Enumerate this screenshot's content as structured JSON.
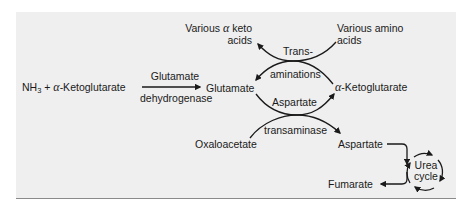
{
  "diagram": {
    "title": "",
    "nodes": {
      "various_keto_acids": {
        "line1_prefix": "Various ",
        "greek": "α",
        "line1_suffix": " keto",
        "line2": "acids"
      },
      "various_amino_acids": {
        "line1": "Various amino",
        "line2": "acids"
      },
      "nh3": {
        "base": "NH",
        "sub": "3",
        "plus": " + ",
        "greek": "α",
        "rest": "-Ketoglutarate"
      },
      "glutamate": "Glutamate",
      "alpha_ketoglutarate": {
        "greek": "α",
        "rest": "-Ketoglutarate"
      },
      "oxaloacetate": "Oxaloacetate",
      "aspartate": "Aspartate",
      "fumarate": "Fumarate",
      "urea_cycle": {
        "line1": "Urea",
        "line2": "cycle"
      }
    },
    "enzymes": {
      "glutamate_dehydrogenase": {
        "top": "Glutamate",
        "bottom": "dehydrogenase"
      },
      "transaminations": {
        "top": "Trans-",
        "bottom": "aminations"
      },
      "aspartate_transaminase": {
        "top": "Aspartate",
        "bottom": "transaminase"
      }
    },
    "edges": [
      {
        "from": "NH3 + α-Ketoglutarate",
        "to": "Glutamate",
        "label": "Glutamate dehydrogenase"
      },
      {
        "from": "Various amino acids",
        "to": "Glutamate",
        "label": "Transaminations"
      },
      {
        "from": "α-Ketoglutarate",
        "to": "Various α keto acids",
        "label": "Transaminations"
      },
      {
        "from": "Glutamate",
        "to": "α-Ketoglutarate",
        "label": "Aspartate transaminase"
      },
      {
        "from": "Oxaloacetate",
        "to": "Aspartate",
        "label": "Aspartate transaminase"
      },
      {
        "from": "Aspartate",
        "to": "Urea cycle"
      },
      {
        "from": "Urea cycle",
        "to": "Fumarate"
      }
    ],
    "colors": {
      "panel_bg": "#efefef",
      "ink": "#1a1a1a",
      "border": "#8a8a8a"
    }
  }
}
